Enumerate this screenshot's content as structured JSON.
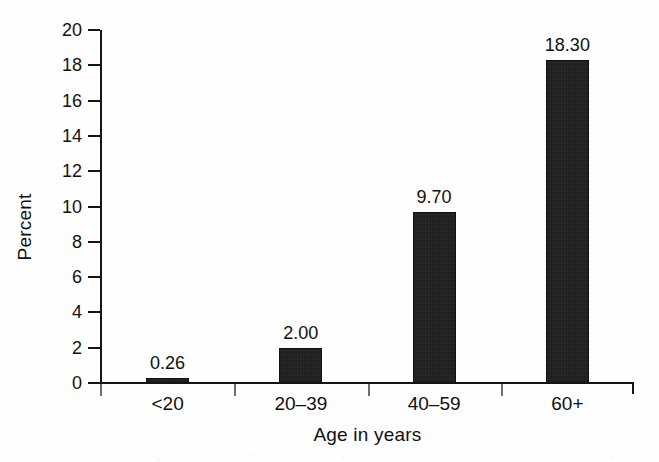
{
  "chart_data": {
    "type": "bar",
    "title": "",
    "subtitle": "",
    "xlabel": "Age in years",
    "ylabel": "Percent",
    "categories": [
      "<20",
      "20–39",
      "40–59",
      "60+"
    ],
    "values": [
      0.26,
      2.0,
      9.7,
      18.3
    ],
    "data_labels": [
      "0.26",
      "2.00",
      "9.70",
      "18.30"
    ],
    "ylim": [
      0,
      20
    ],
    "ytick_step": 2,
    "ytick_labels": [
      "0",
      "2",
      "4",
      "6",
      "8",
      "10",
      "12",
      "14",
      "16",
      "18",
      "20"
    ],
    "grid": false,
    "legend": false,
    "legend_position": "none",
    "bar_color": "#1c1c1c",
    "axis_color": "#151515",
    "background_color": "#ffffff",
    "series": [
      {
        "name": "Percent",
        "values": [
          0.26,
          2.0,
          9.7,
          18.3
        ]
      }
    ]
  },
  "axes": {
    "y_axis_label": "Percent",
    "x_axis_label": "Age in years"
  }
}
